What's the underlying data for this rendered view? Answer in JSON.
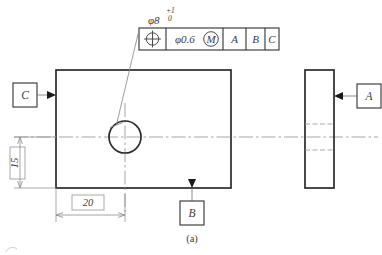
{
  "drawing": {
    "caption": "(a)",
    "title_dimension": {
      "symbol": "φ8",
      "tol_upper": "+1",
      "tol_lower": "0"
    },
    "feature_control_frame": {
      "geometric_symbol": "position-symbol",
      "tolerance_value": "φ0.6",
      "material_modifier": "M",
      "datum_primary": "A",
      "datum_secondary": "B",
      "datum_tertiary": "C"
    },
    "datum_features": [
      {
        "label": "C",
        "position": "left"
      },
      {
        "label": "A",
        "position": "right"
      },
      {
        "label": "B",
        "position": "bottom"
      }
    ],
    "dimensions": [
      {
        "value": "20",
        "orientation": "horizontal",
        "basic": true
      },
      {
        "value": "15",
        "orientation": "vertical",
        "basic": true
      }
    ],
    "views": {
      "front": {
        "name": "front-view",
        "feature": "circular-hole"
      },
      "side": {
        "name": "side-view",
        "feature": "hidden-hole-edges"
      }
    },
    "colors": {
      "object_line": "#2b2b2b",
      "thin_line": "#8d8d8d",
      "center_line": "#8f8f8f",
      "text": "#3c3c3c",
      "background": "#ffffff"
    }
  }
}
